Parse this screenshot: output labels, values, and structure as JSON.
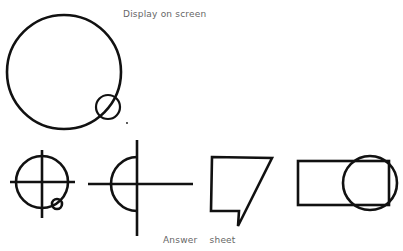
{
  "labels": {
    "display_title": "Display on screen",
    "answer_title": "Answer    sheet"
  },
  "colors": {
    "stroke": "#111111",
    "text": "#666666",
    "background": "#ffffff"
  },
  "display": {
    "large_circle": {
      "cx": 64,
      "cy": 72,
      "r": 57
    },
    "small_circle": {
      "cx": 108,
      "cy": 107,
      "r": 12
    },
    "dot": {
      "cx": 127,
      "cy": 123
    }
  },
  "answer_figures": [
    {
      "id": "cross-circle-with-small-circle"
    },
    {
      "id": "half-circle-on-cross"
    },
    {
      "id": "quadrilateral-with-notch"
    },
    {
      "id": "rectangle-with-circle"
    }
  ]
}
